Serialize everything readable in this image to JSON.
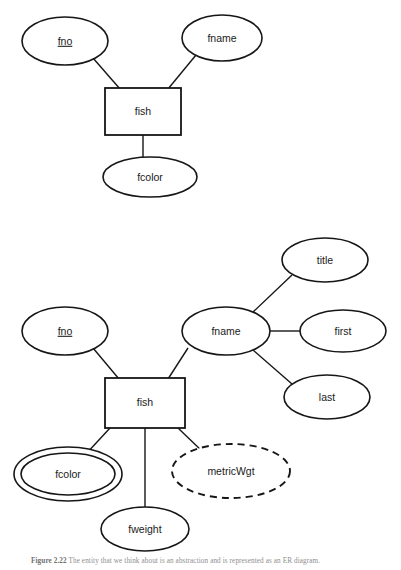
{
  "figure": {
    "caption_label": "Figure 2.22",
    "caption_text": "The entity that we think about is an abstraction and is represented as an ER diagram."
  },
  "diagrams": [
    {
      "id": "simple-fish",
      "entity": {
        "label": "fish"
      },
      "attributes": [
        {
          "label": "fno",
          "kind": "key"
        },
        {
          "label": "fname",
          "kind": "simple"
        },
        {
          "label": "fcolor",
          "kind": "simple"
        }
      ]
    },
    {
      "id": "extended-fish",
      "entity": {
        "label": "fish"
      },
      "attributes": [
        {
          "label": "fno",
          "kind": "key"
        },
        {
          "label": "fname",
          "kind": "composite"
        },
        {
          "label": "title",
          "kind": "simple"
        },
        {
          "label": "first",
          "kind": "simple"
        },
        {
          "label": "last",
          "kind": "simple"
        },
        {
          "label": "fcolor",
          "kind": "multivalued"
        },
        {
          "label": "metricWgt",
          "kind": "derived"
        },
        {
          "label": "fweight",
          "kind": "simple"
        }
      ]
    }
  ],
  "nodes": {
    "d1_fno": "fno",
    "d1_fname": "fname",
    "d1_fish": "fish",
    "d1_fcolor": "fcolor",
    "d2_fno": "fno",
    "d2_fname": "fname",
    "d2_title": "title",
    "d2_first": "first",
    "d2_last": "last",
    "d2_fish": "fish",
    "d2_fcolor": "fcolor",
    "d2_metricwgt": "metricWgt",
    "d2_fweight": "fweight"
  },
  "colors": {
    "stroke": "#161616",
    "fill": "#ffffff",
    "text": "#1a1a1a",
    "caption": "#8e8e8e"
  }
}
